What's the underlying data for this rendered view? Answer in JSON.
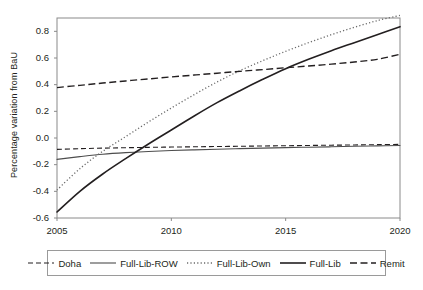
{
  "chart_data": {
    "type": "line",
    "title": "",
    "xlabel": "",
    "ylabel": "Percentage variation from BaU",
    "xlim": [
      2005,
      2020
    ],
    "ylim": [
      -0.6,
      0.9
    ],
    "grid": false,
    "legend_position": "bottom",
    "x": [
      2005,
      2006,
      2007,
      2008,
      2009,
      2010,
      2011,
      2012,
      2013,
      2014,
      2015,
      2016,
      2017,
      2018,
      2019,
      2020
    ],
    "xticks": [
      2005,
      2010,
      2015,
      2020
    ],
    "xtick_labels": [
      "2005",
      "2010",
      "2015",
      "2020"
    ],
    "yticks": [
      -0.6,
      -0.4,
      -0.2,
      0.0,
      0.2,
      0.4,
      0.6,
      0.8
    ],
    "ytick_labels": [
      "-0.6",
      "-0.4",
      "-0.2",
      "0.0",
      "0.2",
      "0.4",
      "0.6",
      "0.8"
    ],
    "series": [
      {
        "name": "Doha",
        "style": "dashed",
        "color": "#231f20",
        "width": 1.1,
        "dash": "5,3",
        "values": [
          -0.085,
          -0.08,
          -0.076,
          -0.073,
          -0.07,
          -0.068,
          -0.066,
          -0.064,
          -0.062,
          -0.06,
          -0.058,
          -0.056,
          -0.054,
          -0.052,
          -0.05,
          -0.048
        ]
      },
      {
        "name": "Full-Lib-ROW",
        "style": "solid",
        "color": "#4d4d4d",
        "width": 1.1,
        "dash": "",
        "values": [
          -0.16,
          -0.14,
          -0.122,
          -0.11,
          -0.101,
          -0.094,
          -0.089,
          -0.084,
          -0.08,
          -0.076,
          -0.072,
          -0.069,
          -0.066,
          -0.062,
          -0.059,
          -0.056
        ]
      },
      {
        "name": "Full-Lib-Own",
        "style": "dotted",
        "color": "#6b6b6b",
        "width": 1.3,
        "dash": "1.2,2.2",
        "values": [
          -0.39,
          -0.23,
          -0.1,
          0.01,
          0.12,
          0.225,
          0.325,
          0.42,
          0.505,
          0.58,
          0.65,
          0.715,
          0.775,
          0.83,
          0.88,
          0.92
        ]
      },
      {
        "name": "Full-Lib",
        "style": "solid",
        "color": "#231f20",
        "width": 1.6,
        "dash": "",
        "values": [
          -0.555,
          -0.4,
          -0.27,
          -0.155,
          -0.045,
          0.06,
          0.165,
          0.265,
          0.355,
          0.44,
          0.52,
          0.59,
          0.655,
          0.715,
          0.775,
          0.835
        ]
      },
      {
        "name": "Remit",
        "style": "dashed",
        "color": "#231f20",
        "width": 1.4,
        "dash": "7,3.5",
        "values": [
          0.378,
          0.395,
          0.412,
          0.428,
          0.443,
          0.458,
          0.472,
          0.486,
          0.5,
          0.513,
          0.527,
          0.54,
          0.554,
          0.57,
          0.59,
          0.628
        ]
      }
    ],
    "legend": [
      {
        "label": "Doha",
        "style": "dashed",
        "color": "#231f20",
        "width": 1.1,
        "dash": "5,3"
      },
      {
        "label": "Full-Lib-ROW",
        "style": "solid",
        "color": "#4d4d4d",
        "width": 1.1,
        "dash": ""
      },
      {
        "label": "Full-Lib-Own",
        "style": "dotted",
        "color": "#6b6b6b",
        "width": 1.3,
        "dash": "1.2,2.2"
      },
      {
        "label": "Full-Lib",
        "style": "solid",
        "color": "#231f20",
        "width": 1.6,
        "dash": ""
      },
      {
        "label": "Remit",
        "style": "dashed",
        "color": "#231f20",
        "width": 1.4,
        "dash": "7,3.5"
      }
    ],
    "axis_color": "#8a8a8a"
  }
}
